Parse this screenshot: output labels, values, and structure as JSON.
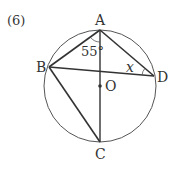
{
  "problem_number": "(6)",
  "points": {
    "A": {
      "label": "A",
      "x": 100,
      "y": 30
    },
    "B": {
      "label": "B",
      "x": 49,
      "y": 67
    },
    "C": {
      "label": "C",
      "x": 100,
      "y": 142
    },
    "D": {
      "label": "D",
      "x": 154,
      "y": 76
    },
    "O": {
      "label": "O",
      "x": 100,
      "y": 86
    }
  },
  "circle": {
    "cx": 100,
    "cy": 86,
    "r": 56
  },
  "angles": {
    "BAC": {
      "label": "55°"
    },
    "ADB": {
      "label": "x"
    }
  },
  "colors": {
    "stroke": "#333333",
    "circle": "#555555"
  }
}
